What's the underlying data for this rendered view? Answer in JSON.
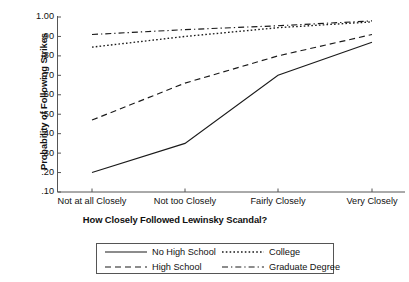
{
  "chart_data": {
    "type": "line",
    "title": "",
    "xlabel": "How Closely Followed Lewinsky Scandal?",
    "ylabel": "Probability of Following Strikes",
    "categories": [
      "Not at all Closely",
      "Not too Closely",
      "Fairly Closely",
      "Very Closely"
    ],
    "ylim": [
      0.1,
      1.0
    ],
    "ytick_labels": [
      "1.00",
      ".90",
      ".80",
      ".70",
      ".60",
      ".50",
      ".40",
      ".30",
      ".20",
      ".10"
    ],
    "ytick_values": [
      1.0,
      0.9,
      0.8,
      0.7,
      0.6,
      0.5,
      0.4,
      0.3,
      0.2,
      0.1
    ],
    "grid": false,
    "legend_position": "below-axes",
    "series": [
      {
        "name": "No High School",
        "style": "solid",
        "values": [
          0.2,
          0.35,
          0.7,
          0.87
        ]
      },
      {
        "name": "High School",
        "style": "dashed",
        "values": [
          0.47,
          0.66,
          0.8,
          0.91
        ]
      },
      {
        "name": "College",
        "style": "dotted",
        "values": [
          0.845,
          0.9,
          0.945,
          0.975
        ]
      },
      {
        "name": "Graduate Degree",
        "style": "dashdot",
        "values": [
          0.91,
          0.935,
          0.955,
          0.98
        ]
      }
    ],
    "colors": {
      "line": "#1a1a1a",
      "axis": "#555555",
      "background": "#ffffff"
    }
  },
  "legend": {
    "entries": [
      {
        "label": "No High School",
        "style": "solid"
      },
      {
        "label": "College",
        "style": "dotted"
      },
      {
        "label": "High School",
        "style": "dashed"
      },
      {
        "label": "Graduate Degree",
        "style": "dashdot"
      }
    ]
  }
}
